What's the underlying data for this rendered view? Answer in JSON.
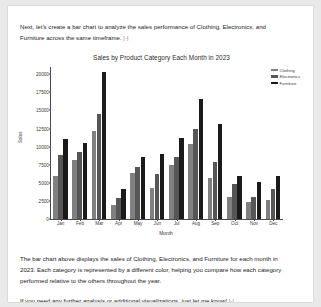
{
  "intro_paragraph": {
    "lines": [
      "Next, let's create a bar chart to analyze the sales performance of Clothing, Electronics, and",
      "Furniture across the same timeframe."
    ],
    "collapse_marker": "[-]"
  },
  "summary_paragraph": {
    "lines": [
      "The bar chart above displays the sales of Clothing, Electronics, and Furniture for each month in",
      "2023. Each category is represented by a different color, helping you compare how each category",
      "performed relative to the others throughout the year."
    ]
  },
  "closing_paragraph": {
    "lines": [
      "If you need any further analysis or additional visualizations, just let me know!"
    ],
    "collapse_marker": "[-]"
  },
  "chart_data": {
    "type": "bar",
    "title": "Sales by Product Category Each Month in 2023",
    "xlabel": "Month",
    "ylabel": "Sales",
    "categories": [
      "Jan",
      "Feb",
      "Mar",
      "Apr",
      "May",
      "Jun",
      "Jul",
      "Aug",
      "Sep",
      "Oct",
      "Nov",
      "Dec"
    ],
    "ylim": [
      0,
      21000
    ],
    "yticks": [
      0,
      2500,
      5000,
      7500,
      10000,
      12500,
      15000,
      17500,
      20000
    ],
    "ytick_labels": [
      "0",
      "2500",
      "5000",
      "7500",
      "10000",
      "12500",
      "15000",
      "17500",
      "20000"
    ],
    "grid": false,
    "legend_position": "upper right",
    "series": [
      {
        "name": "Clothing",
        "color": "#808080",
        "values": [
          5900,
          8100,
          12100,
          2000,
          6300,
          4300,
          7400,
          10300,
          5600,
          3100,
          2400,
          2600
        ]
      },
      {
        "name": "Electronics",
        "color": "#565656",
        "values": [
          8800,
          9200,
          14500,
          2900,
          7200,
          6200,
          8500,
          12400,
          7900,
          4800,
          3100,
          4100
        ]
      },
      {
        "name": "Furniture",
        "color": "#1a1a1a",
        "values": [
          11000,
          10500,
          20300,
          4200,
          8500,
          9000,
          11200,
          16600,
          13100,
          6000,
          5100,
          5900
        ]
      }
    ]
  }
}
